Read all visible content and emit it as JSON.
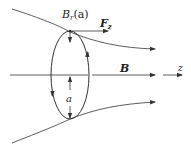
{
  "diagram": {
    "labels": {
      "radial_field": "B",
      "radial_field_sub": "r",
      "radial_field_arg": "(a)",
      "force": "F",
      "force_sub": "z",
      "field": "B",
      "axis": "z",
      "radius": "a"
    },
    "colors": {
      "line": "#333333",
      "background": "#ffffff"
    }
  }
}
